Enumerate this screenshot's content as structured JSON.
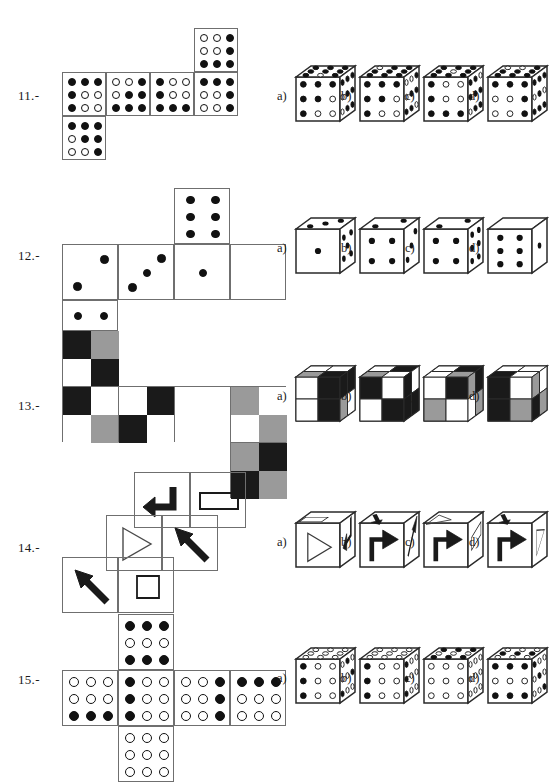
{
  "page": {
    "width": 550,
    "height": 772,
    "background": "#ffffff",
    "ink": "#111111",
    "line": "#6f6f6f",
    "gray": "#9a9a9a",
    "black": "#1a1a1a",
    "white": "#ffffff"
  },
  "option_labels": [
    "a)",
    "b)",
    "c)",
    "d)"
  ],
  "questions": [
    {
      "id": "q11",
      "label": "11.-",
      "label_x": 18,
      "label_y": 88,
      "type": "dot-grid-net",
      "net": {
        "cell": 44,
        "origin_x": 62,
        "origin_y": 28,
        "cells": [
          {
            "col": 3,
            "row": 0,
            "grid": [
              [
                0,
                0,
                1
              ],
              [
                0,
                0,
                1
              ],
              [
                1,
                1,
                1
              ]
            ]
          },
          {
            "col": 0,
            "row": 1,
            "grid": [
              [
                1,
                1,
                1
              ],
              [
                1,
                0,
                0
              ],
              [
                1,
                0,
                0
              ]
            ]
          },
          {
            "col": 1,
            "row": 1,
            "grid": [
              [
                0,
                0,
                1
              ],
              [
                0,
                1,
                1
              ],
              [
                1,
                1,
                1
              ]
            ]
          },
          {
            "col": 2,
            "row": 1,
            "grid": [
              [
                1,
                0,
                0
              ],
              [
                1,
                0,
                0
              ],
              [
                1,
                1,
                1
              ]
            ]
          },
          {
            "col": 3,
            "row": 1,
            "grid": [
              [
                1,
                1,
                1
              ],
              [
                0,
                0,
                1
              ],
              [
                0,
                0,
                1
              ]
            ]
          },
          {
            "col": 0,
            "row": 2,
            "grid": [
              [
                1,
                1,
                1
              ],
              [
                0,
                1,
                1
              ],
              [
                0,
                0,
                1
              ]
            ]
          }
        ]
      },
      "options": [
        {
          "label": "a)",
          "x": 296,
          "y": 66,
          "front": [
            [
              1,
              1,
              1
            ],
            [
              1,
              1,
              0
            ],
            [
              1,
              0,
              0
            ]
          ],
          "top": [
            [
              1,
              1,
              1
            ],
            [
              1,
              1,
              1
            ],
            [
              1,
              0,
              1
            ]
          ],
          "side": [
            [
              1,
              1,
              1
            ],
            [
              0,
              1,
              1
            ],
            [
              0,
              1,
              1
            ]
          ]
        },
        {
          "label": "b)",
          "x": 360,
          "y": 66,
          "front": [
            [
              1,
              1,
              1
            ],
            [
              1,
              1,
              0
            ],
            [
              1,
              0,
              0
            ]
          ],
          "top": [
            [
              0,
              1,
              1
            ],
            [
              1,
              1,
              1
            ],
            [
              1,
              1,
              1
            ]
          ],
          "side": [
            [
              0,
              0,
              1
            ],
            [
              0,
              1,
              1
            ],
            [
              1,
              1,
              0
            ]
          ]
        },
        {
          "label": "c)",
          "x": 424,
          "y": 66,
          "front": [
            [
              1,
              0,
              0
            ],
            [
              1,
              0,
              0
            ],
            [
              1,
              1,
              1
            ]
          ],
          "top": [
            [
              1,
              1,
              1
            ],
            [
              1,
              0,
              1
            ],
            [
              1,
              1,
              1
            ]
          ],
          "side": [
            [
              1,
              1,
              0
            ],
            [
              1,
              1,
              1
            ],
            [
              0,
              1,
              1
            ]
          ]
        },
        {
          "label": "d)",
          "x": 488,
          "y": 66,
          "front": [
            [
              1,
              1,
              1
            ],
            [
              0,
              0,
              1
            ],
            [
              0,
              0,
              1
            ]
          ],
          "top": [
            [
              0,
              0,
              1
            ],
            [
              1,
              1,
              1
            ],
            [
              1,
              1,
              1
            ]
          ],
          "side": [
            [
              1,
              1,
              1
            ],
            [
              0,
              1,
              0
            ],
            [
              1,
              1,
              1
            ]
          ]
        }
      ]
    },
    {
      "id": "q12",
      "label": "12.-",
      "label_x": 18,
      "label_y": 248,
      "type": "pip-net",
      "net": {
        "cell": 56,
        "origin_x": 62,
        "origin_y": 188,
        "cells": [
          {
            "col": 2,
            "row": 0,
            "pips": 6
          },
          {
            "col": 0,
            "row": 1,
            "pips": 2
          },
          {
            "col": 1,
            "row": 1,
            "pips": 3
          },
          {
            "col": 2,
            "row": 1,
            "pips": 1
          },
          {
            "col": 3,
            "row": 1,
            "pips": 0
          },
          {
            "col": 0,
            "row": 2,
            "pips": 4
          }
        ]
      },
      "options": [
        {
          "label": "a)",
          "x": 296,
          "y": 218,
          "front": 1,
          "top": 3,
          "side": 5
        },
        {
          "label": "b)",
          "x": 360,
          "y": 218,
          "front": 4,
          "top": 2,
          "side": 3
        },
        {
          "label": "c)",
          "x": 424,
          "y": 218,
          "front": 4,
          "top": 2,
          "side": 6
        },
        {
          "label": "d)",
          "x": 488,
          "y": 218,
          "front": 6,
          "top": 0,
          "side": 1
        }
      ]
    },
    {
      "id": "q13",
      "label": "13.-",
      "label_x": 18,
      "label_y": 398,
      "type": "checker-net",
      "net": {
        "cell": 56,
        "half": 28,
        "origin_x": 62,
        "origin_y": 330,
        "cells": [
          {
            "col": 0,
            "row": 0,
            "quads": [
              "black",
              "gray",
              "white",
              "black"
            ]
          },
          {
            "col": 0,
            "row": 1,
            "quads": [
              "black",
              "white",
              "white",
              "gray"
            ]
          },
          {
            "col": 1,
            "row": 1,
            "quads": [
              "white",
              "black",
              "black",
              "white"
            ]
          },
          {
            "col": 2,
            "row": 1,
            "quads": [
              "white",
              "white",
              "white",
              "white"
            ]
          },
          {
            "col": 3,
            "row": 1,
            "quads": [
              "gray",
              "white",
              "white",
              "gray"
            ]
          },
          {
            "col": 3,
            "row": 2,
            "quads": [
              "gray",
              "black",
              "black",
              "gray"
            ]
          }
        ]
      },
      "options": [
        {
          "label": "a)",
          "x": 296,
          "y": 366,
          "front": [
            "white",
            "black",
            "white",
            "black"
          ],
          "top": [
            "white",
            "white",
            "gray",
            "black"
          ],
          "side": [
            "black",
            "black",
            "gray",
            "white"
          ]
        },
        {
          "label": "b)",
          "x": 360,
          "y": 366,
          "front": [
            "black",
            "white",
            "white",
            "black"
          ],
          "top": [
            "white",
            "black",
            "gray",
            "white"
          ],
          "side": [
            "black",
            "white",
            "black",
            "black"
          ]
        },
        {
          "label": "c)",
          "x": 424,
          "y": 366,
          "front": [
            "white",
            "black",
            "gray",
            "white"
          ],
          "top": [
            "white",
            "black",
            "white",
            "gray"
          ],
          "side": [
            "gray",
            "black",
            "white",
            "gray"
          ]
        },
        {
          "label": "d)",
          "x": 488,
          "y": 366,
          "front": [
            "black",
            "white",
            "black",
            "gray"
          ],
          "top": [
            "white",
            "white",
            "black",
            "white"
          ],
          "side": [
            "gray",
            "white",
            "black",
            "gray"
          ]
        }
      ]
    },
    {
      "id": "q14",
      "label": "14.-",
      "label_x": 18,
      "label_y": 540,
      "type": "symbol-net",
      "net": {
        "cell": 56,
        "cells": [
          {
            "x": 134,
            "y": 472,
            "symbol": "bent-arrow-left"
          },
          {
            "x": 190,
            "y": 472,
            "symbol": "rectangle"
          },
          {
            "x": 106,
            "y": 515,
            "symbol": "triangle-right"
          },
          {
            "x": 162,
            "y": 515,
            "symbol": "arrow-upleft"
          },
          {
            "x": 62,
            "y": 557,
            "symbol": "arrow-upleft"
          },
          {
            "x": 118,
            "y": 557,
            "symbol": "square"
          }
        ]
      },
      "options": [
        {
          "label": "a)",
          "x": 296,
          "y": 512,
          "front": "triangle-right",
          "top": "rectangle",
          "side": "bent-arrow-down"
        },
        {
          "label": "b)",
          "x": 360,
          "y": 512,
          "front": "bent-arrow-up",
          "top": "arrow-down",
          "side": "arrow-upright"
        },
        {
          "label": "c)",
          "x": 424,
          "y": 512,
          "front": "bent-arrow-up",
          "top": "triangle-right",
          "side": "rectangle"
        },
        {
          "label": "d)",
          "x": 488,
          "y": 512,
          "front": "bent-arrow-up",
          "top": "arrow-down",
          "side": "triangle-right"
        }
      ]
    },
    {
      "id": "q15",
      "label": "15.-",
      "label_x": 18,
      "label_y": 672,
      "type": "dot-grid-net",
      "net": {
        "cell": 56,
        "origin_x": 62,
        "origin_y": 614,
        "cells": [
          {
            "col": 1,
            "row": 0,
            "grid": [
              [
                1,
                1,
                1
              ],
              [
                0,
                0,
                0
              ],
              [
                1,
                1,
                1
              ]
            ]
          },
          {
            "col": 0,
            "row": 1,
            "grid": [
              [
                0,
                0,
                0
              ],
              [
                0,
                0,
                0
              ],
              [
                1,
                1,
                1
              ]
            ]
          },
          {
            "col": 1,
            "row": 1,
            "grid": [
              [
                1,
                0,
                0
              ],
              [
                1,
                0,
                0
              ],
              [
                1,
                0,
                0
              ]
            ]
          },
          {
            "col": 2,
            "row": 1,
            "grid": [
              [
                0,
                0,
                1
              ],
              [
                0,
                0,
                1
              ],
              [
                0,
                0,
                1
              ]
            ]
          },
          {
            "col": 3,
            "row": 1,
            "grid": [
              [
                1,
                1,
                1
              ],
              [
                0,
                0,
                0
              ],
              [
                0,
                0,
                0
              ]
            ]
          },
          {
            "col": 1,
            "row": 2,
            "grid": [
              [
                0,
                0,
                0
              ],
              [
                0,
                0,
                0
              ],
              [
                0,
                0,
                0
              ]
            ]
          }
        ]
      },
      "options": [
        {
          "label": "a)",
          "x": 296,
          "y": 648,
          "front": [
            [
              1,
              0,
              0
            ],
            [
              1,
              0,
              0
            ],
            [
              1,
              0,
              0
            ]
          ],
          "top": [
            [
              0,
              0,
              0
            ],
            [
              0,
              0,
              0
            ],
            [
              0,
              0,
              0
            ]
          ],
          "side": [
            [
              0,
              1,
              0
            ],
            [
              0,
              0,
              1
            ],
            [
              1,
              0,
              0
            ]
          ]
        },
        {
          "label": "b)",
          "x": 360,
          "y": 648,
          "front": [
            [
              1,
              0,
              0
            ],
            [
              1,
              0,
              0
            ],
            [
              1,
              0,
              0
            ]
          ],
          "top": [
            [
              0,
              0,
              0
            ],
            [
              0,
              0,
              0
            ],
            [
              0,
              0,
              0
            ]
          ],
          "side": [
            [
              1,
              0,
              0
            ],
            [
              1,
              0,
              0
            ],
            [
              1,
              0,
              0
            ]
          ]
        },
        {
          "label": "c)",
          "x": 424,
          "y": 648,
          "front": [
            [
              0,
              0,
              0
            ],
            [
              0,
              0,
              0
            ],
            [
              0,
              0,
              0
            ]
          ],
          "top": [
            [
              1,
              1,
              1
            ],
            [
              0,
              0,
              0
            ],
            [
              1,
              1,
              1
            ]
          ],
          "side": [
            [
              0,
              0,
              0
            ],
            [
              0,
              0,
              0
            ],
            [
              0,
              0,
              0
            ]
          ]
        },
        {
          "label": "d)",
          "x": 488,
          "y": 648,
          "front": [
            [
              1,
              1,
              1
            ],
            [
              0,
              0,
              0
            ],
            [
              1,
              1,
              1
            ]
          ],
          "top": [
            [
              0,
              0,
              0
            ],
            [
              1,
              1,
              1
            ],
            [
              0,
              0,
              0
            ]
          ],
          "side": [
            [
              1,
              0,
              0
            ],
            [
              0,
              1,
              0
            ],
            [
              0,
              0,
              1
            ]
          ]
        }
      ]
    }
  ]
}
